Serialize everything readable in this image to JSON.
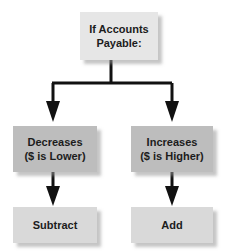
{
  "diagram": {
    "type": "flowchart",
    "root": {
      "label_line1": "If Accounts",
      "label_line2": "Payable:"
    },
    "branches": [
      {
        "condition_line1": "Decreases",
        "condition_line2": "($ is Lower)",
        "result": "Subtract"
      },
      {
        "condition_line1": "Increases",
        "condition_line2": "($ is Higher)",
        "result": "Add"
      }
    ],
    "colors": {
      "root_fill": "#e6e6e6",
      "condition_fill": "#bdbdbd",
      "result_fill": "#d9d9d9",
      "line": "#111111"
    }
  }
}
